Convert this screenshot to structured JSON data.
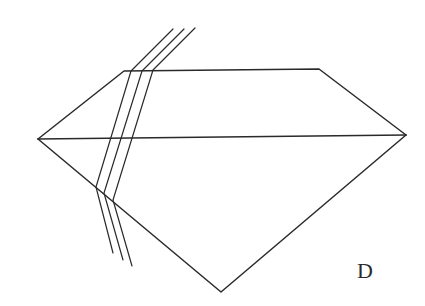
{
  "figure": {
    "label": "D",
    "ray_count": 3,
    "colors": {
      "line": "#2a2a2a",
      "background": "#ffffff"
    }
  }
}
